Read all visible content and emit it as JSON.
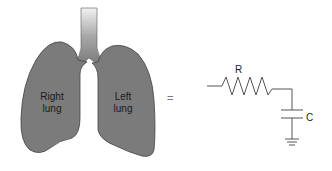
{
  "diagram": {
    "lungs": {
      "right_label_line1": "Right",
      "right_label_line2": "lung",
      "left_label_line1": "Left",
      "left_label_line2": "lung"
    },
    "equals_sign": "=",
    "circuit": {
      "resistor_label": "R",
      "capacitor_label": "C"
    },
    "colors": {
      "lung_fill": "#7b7b7b",
      "lung_stroke": "#4a4a4a",
      "wire": "#555555"
    }
  }
}
